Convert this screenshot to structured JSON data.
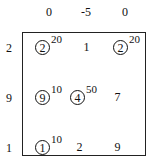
{
  "column_headers": [
    "0",
    "-5",
    "0"
  ],
  "row_headers": [
    "2",
    "9",
    "1"
  ],
  "cells": [
    [
      {
        "value": "2",
        "circled": true,
        "sup": "20"
      },
      {
        "value": "1",
        "circled": false,
        "sup": ""
      },
      {
        "value": "2",
        "circled": true,
        "sup": "20"
      }
    ],
    [
      {
        "value": "9",
        "circled": true,
        "sup": "10"
      },
      {
        "value": "4",
        "circled": true,
        "sup": "50"
      },
      {
        "value": "7",
        "circled": false,
        "sup": ""
      }
    ],
    [
      {
        "value": "1",
        "circled": true,
        "sup": "10"
      },
      {
        "value": "2",
        "circled": false,
        "sup": ""
      },
      {
        "value": "9",
        "circled": false,
        "sup": ""
      }
    ]
  ]
}
